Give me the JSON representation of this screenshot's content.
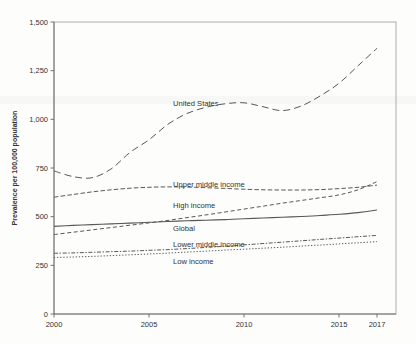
{
  "chart_data": {
    "type": "line",
    "title": "",
    "xlabel": "",
    "ylabel": "Prevalence per 100,000 population",
    "xlim": [
      2000,
      2018
    ],
    "ylim": [
      0,
      1500
    ],
    "grid": false,
    "legend": "inline-labels-right-of-midpoint",
    "frame": "full-box",
    "line_color": "#585858",
    "text_color": "#333333",
    "frame_color": "#999999",
    "axis_color": "#666666",
    "x": [
      2000,
      2001,
      2002,
      2003,
      2004,
      2005,
      2006,
      2007,
      2008,
      2009,
      2010,
      2011,
      2012,
      2013,
      2014,
      2015,
      2016,
      2017
    ],
    "xticks": [
      {
        "value": 2000,
        "label": "2000"
      },
      {
        "value": 2005,
        "label": "2005"
      },
      {
        "value": 2010,
        "label": "2010"
      },
      {
        "value": 2015,
        "label": "2015"
      },
      {
        "value": 2017,
        "label": "2017"
      }
    ],
    "yticks": [
      {
        "value": 0,
        "label": "0"
      },
      {
        "value": 250,
        "label": "250"
      },
      {
        "value": 500,
        "label": "500"
      },
      {
        "value": 750,
        "label": "750"
      },
      {
        "value": 1000,
        "label": "1,000"
      },
      {
        "value": 1250,
        "label": "1,250"
      },
      {
        "value": 1500,
        "label": "1,500"
      }
    ],
    "series": [
      {
        "name": "United States",
        "dash": "long-dash",
        "values": [
          735,
          706,
          700,
          745,
          830,
          895,
          975,
          1030,
          1062,
          1080,
          1085,
          1065,
          1045,
          1068,
          1120,
          1185,
          1275,
          1365
        ],
        "label_px": {
          "x": 173,
          "y": 106
        }
      },
      {
        "name": "Upper middle income",
        "dash": "short-dash",
        "values": [
          600,
          614,
          627,
          638,
          646,
          651,
          653,
          652,
          649,
          645,
          641,
          638,
          637,
          637,
          639,
          644,
          651,
          662
        ],
        "label_px": {
          "x": 173,
          "y": 187
        }
      },
      {
        "name": "High income",
        "dash": "dash",
        "values": [
          408,
          420,
          432,
          444,
          456,
          468,
          481,
          495,
          509,
          524,
          539,
          554,
          569,
          583,
          597,
          612,
          638,
          680
        ],
        "label_px": {
          "x": 173,
          "y": 208
        }
      },
      {
        "name": "Global",
        "dash": "solid",
        "values": [
          450,
          455,
          459,
          463,
          467,
          471,
          475,
          479,
          482,
          485,
          489,
          493,
          497,
          501,
          506,
          512,
          521,
          534
        ],
        "label_px": {
          "x": 173,
          "y": 231
        }
      },
      {
        "name": "Lower middle income",
        "dash": "dash-dot",
        "values": [
          312,
          314,
          317,
          320,
          323,
          327,
          331,
          336,
          342,
          348,
          355,
          362,
          369,
          376,
          383,
          390,
          397,
          404
        ],
        "label_px": {
          "x": 173,
          "y": 247
        }
      },
      {
        "name": "Low income",
        "dash": "dotted",
        "values": [
          290,
          293,
          296,
          300,
          304,
          308,
          313,
          318,
          323,
          328,
          333,
          338,
          343,
          349,
          354,
          360,
          366,
          372
        ],
        "label_px": {
          "x": 173,
          "y": 264
        }
      }
    ]
  }
}
